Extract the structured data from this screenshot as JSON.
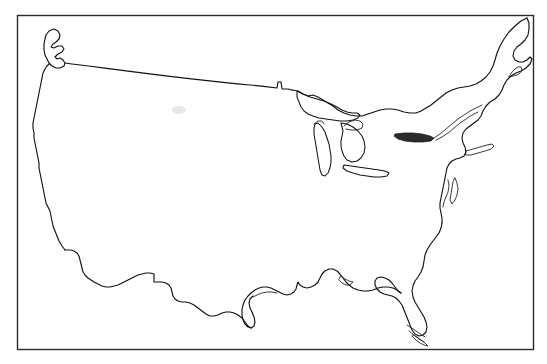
{
  "document": {
    "title": "Outline Map of the Contiguous United States",
    "type": "line-art map",
    "background_color": "#ffffff",
    "ink_color": "#111111",
    "caption": ""
  },
  "frame": {
    "name": "map-border",
    "shape": "rectangle",
    "stroke_color": "#2a2a2a",
    "x": 17,
    "y": 15,
    "width": 517,
    "height": 335
  },
  "map": {
    "region": "Contiguous United States",
    "projection_note": "conic",
    "features": [
      {
        "id": "mainland-outline",
        "label": "United States mainland coastline and borders",
        "interactable": false
      },
      {
        "id": "northern-border",
        "label": "United States Canada border (49th parallel)",
        "interactable": false
      },
      {
        "id": "southern-border",
        "label": "United States Mexico border",
        "interactable": false
      },
      {
        "id": "pacific-coast",
        "label": "Pacific coastline",
        "interactable": false
      },
      {
        "id": "atlantic-coast",
        "label": "Atlantic coastline",
        "interactable": false
      },
      {
        "id": "gulf-coast",
        "label": "Gulf of Mexico coastline",
        "interactable": false
      },
      {
        "id": "florida-peninsula",
        "label": "Florida peninsula and Keys",
        "interactable": false
      }
    ],
    "lakes": [
      {
        "id": "lake-superior",
        "label": "Lake Superior"
      },
      {
        "id": "lake-michigan",
        "label": "Lake Michigan"
      },
      {
        "id": "lake-huron",
        "label": "Lake Huron"
      },
      {
        "id": "lake-erie",
        "label": "Lake Erie"
      },
      {
        "id": "lake-ontario",
        "label": "Lake Ontario"
      }
    ],
    "islands": [
      {
        "id": "long-island",
        "label": "Long Island"
      },
      {
        "id": "cape-cod",
        "label": "Cape Cod"
      },
      {
        "id": "vancouver-island",
        "label": "Vancouver Island / Puget Sound"
      },
      {
        "id": "florida-keys",
        "label": "Florida Keys"
      }
    ],
    "labels_visible": false,
    "legend_visible": false,
    "scale_bar_visible": false,
    "graticule_visible": false
  }
}
